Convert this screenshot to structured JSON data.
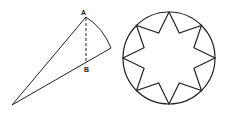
{
  "figure": {
    "left": {
      "type": "cone-cross-section",
      "labels": {
        "apex_top": "A",
        "foot": "B"
      },
      "points": {
        "A": [
          86,
          17
        ],
        "right": [
          111,
          48
        ],
        "B": [
          86,
          64
        ],
        "tip": [
          12,
          105
        ]
      }
    },
    "right": {
      "type": "eight-point-star-in-circle",
      "center": [
        169,
        58
      ],
      "radius": 46,
      "inner_radius": 27,
      "points": 8
    },
    "colors": {
      "stroke": "#222222",
      "background": "#ffffff"
    }
  }
}
